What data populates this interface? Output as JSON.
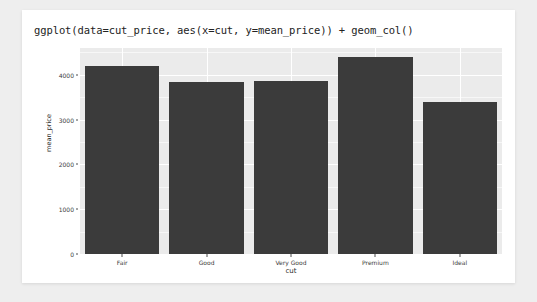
{
  "title": "ggplot(data=cut_price, aes(x=cut, y=mean_price)) + geom_col()",
  "colors": {
    "page_background": "#eeeeee",
    "card_background": "#ffffff",
    "panel_background": "#ebebeb",
    "gridline": "#ffffff",
    "bar_fill": "#3b3b3b",
    "text": "#2b2b2b"
  },
  "chart_data": {
    "type": "bar",
    "title": "ggplot(data=cut_price, aes(x=cut, y=mean_price)) + geom_col()",
    "xlabel": "cut",
    "ylabel": "mean_price",
    "categories": [
      "Fair",
      "Good",
      "Very Good",
      "Premium",
      "Ideal"
    ],
    "values": [
      4190,
      3850,
      3870,
      4400,
      3400
    ],
    "ylim": [
      0,
      4600
    ],
    "yticks": [
      0,
      1000,
      2000,
      3000,
      4000
    ],
    "ytick_labels": [
      "0",
      "1000",
      "2000",
      "3000",
      "4000"
    ],
    "yminor": [
      500,
      1500,
      2500,
      3500,
      4500
    ],
    "grid": true,
    "legend": "none",
    "bar_color": "#3b3b3b"
  }
}
